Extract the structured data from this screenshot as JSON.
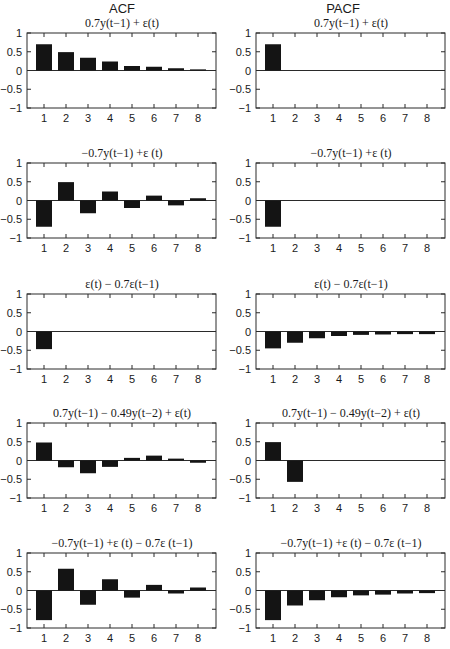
{
  "columns": [
    "ACF",
    "PACF"
  ],
  "chart_data": [
    {
      "type": "bar",
      "column": "ACF",
      "row": 0,
      "title": "0.7y(t−1) + ε(t)",
      "categories": [
        1,
        2,
        3,
        4,
        5,
        6,
        7,
        8
      ],
      "values": [
        0.7,
        0.49,
        0.34,
        0.24,
        0.12,
        0.1,
        0.06,
        0.03
      ],
      "ylim": [
        -1,
        1
      ],
      "yticks": [
        1,
        0.5,
        0,
        -0.5,
        -1
      ],
      "xlabel": "",
      "ylabel": ""
    },
    {
      "type": "bar",
      "column": "PACF",
      "row": 0,
      "title": "0.7y(t−1) + ε(t)",
      "categories": [
        1,
        2,
        3,
        4,
        5,
        6,
        7,
        8
      ],
      "values": [
        0.7,
        0,
        0,
        0,
        0,
        0,
        0,
        0
      ],
      "ylim": [
        -1,
        1
      ],
      "yticks": [
        1,
        0.5,
        0,
        -0.5,
        -1
      ],
      "xlabel": "",
      "ylabel": ""
    },
    {
      "type": "bar",
      "column": "ACF",
      "row": 1,
      "title": "−0.7y(t−1) +ε (t)",
      "categories": [
        1,
        2,
        3,
        4,
        5,
        6,
        7,
        8
      ],
      "values": [
        -0.7,
        0.49,
        -0.34,
        0.24,
        -0.2,
        0.13,
        -0.13,
        0.06
      ],
      "ylim": [
        -1,
        1
      ],
      "yticks": [
        1,
        0.5,
        0,
        -0.5,
        -1
      ],
      "xlabel": "",
      "ylabel": ""
    },
    {
      "type": "bar",
      "column": "PACF",
      "row": 1,
      "title": "−0.7y(t−1) +ε (t)",
      "categories": [
        1,
        2,
        3,
        4,
        5,
        6,
        7,
        8
      ],
      "values": [
        -0.7,
        0,
        0,
        0,
        0,
        0,
        0,
        0
      ],
      "ylim": [
        -1,
        1
      ],
      "yticks": [
        1,
        0.5,
        0,
        -0.5,
        -1
      ],
      "xlabel": "",
      "ylabel": ""
    },
    {
      "type": "bar",
      "column": "ACF",
      "row": 2,
      "title": "ε(t) − 0.7ε(t−1)",
      "categories": [
        1,
        2,
        3,
        4,
        5,
        6,
        7,
        8
      ],
      "values": [
        -0.47,
        0,
        0,
        0,
        0,
        0,
        0,
        0
      ],
      "ylim": [
        -1,
        1
      ],
      "yticks": [
        1,
        0.5,
        0,
        -0.5,
        -1
      ],
      "xlabel": "",
      "ylabel": ""
    },
    {
      "type": "bar",
      "column": "PACF",
      "row": 2,
      "title": "ε(t) − 0.7ε(t−1)",
      "categories": [
        1,
        2,
        3,
        4,
        5,
        6,
        7,
        8
      ],
      "values": [
        -0.45,
        -0.3,
        -0.18,
        -0.12,
        -0.09,
        -0.08,
        -0.07,
        -0.07
      ],
      "ylim": [
        -1,
        1
      ],
      "yticks": [
        1,
        0.5,
        0,
        -0.5,
        -1
      ],
      "xlabel": "",
      "ylabel": ""
    },
    {
      "type": "bar",
      "column": "ACF",
      "row": 3,
      "title": "0.7y(t−1) − 0.49y(t−2) + ε(t)",
      "categories": [
        1,
        2,
        3,
        4,
        5,
        6,
        7,
        8
      ],
      "values": [
        0.48,
        -0.18,
        -0.34,
        -0.17,
        0.07,
        0.13,
        0.05,
        -0.06
      ],
      "ylim": [
        -1,
        1
      ],
      "yticks": [
        1,
        0.5,
        0,
        -0.5,
        -1
      ],
      "xlabel": "",
      "ylabel": ""
    },
    {
      "type": "bar",
      "column": "PACF",
      "row": 3,
      "title": "0.7y(t−1) − 0.49y(t−2) + ε(t)",
      "categories": [
        1,
        2,
        3,
        4,
        5,
        6,
        7,
        8
      ],
      "values": [
        0.49,
        -0.57,
        0,
        0,
        0,
        0,
        0,
        0
      ],
      "ylim": [
        -1,
        1
      ],
      "yticks": [
        1,
        0.5,
        0,
        -0.5,
        -1
      ],
      "xlabel": "",
      "ylabel": ""
    },
    {
      "type": "bar",
      "column": "ACF",
      "row": 4,
      "title": "−0.7y(t−1) +ε (t) − 0.7ε (t−1)",
      "categories": [
        1,
        2,
        3,
        4,
        5,
        6,
        7,
        8
      ],
      "values": [
        -0.79,
        0.58,
        -0.38,
        0.3,
        -0.19,
        0.15,
        -0.08,
        0.08
      ],
      "ylim": [
        -1,
        1
      ],
      "yticks": [
        1,
        0.5,
        0,
        -0.5,
        -1
      ],
      "xlabel": "",
      "ylabel": ""
    },
    {
      "type": "bar",
      "column": "PACF",
      "row": 4,
      "title": "−0.7y(t−1) +ε (t) − 0.7ε (t−1)",
      "categories": [
        1,
        2,
        3,
        4,
        5,
        6,
        7,
        8
      ],
      "values": [
        -0.79,
        -0.4,
        -0.26,
        -0.18,
        -0.13,
        -0.11,
        -0.08,
        -0.07
      ],
      "ylim": [
        -1,
        1
      ],
      "yticks": [
        1,
        0.5,
        0,
        -0.5,
        -1
      ],
      "xlabel": "",
      "ylabel": ""
    }
  ],
  "ytick_labels": [
    "1",
    "0.5",
    "0",
    "−0.5",
    "−1"
  ],
  "xtick_labels": [
    "1",
    "2",
    "3",
    "4",
    "5",
    "6",
    "7",
    "8"
  ],
  "colors": {
    "bar": "#141414",
    "axis": "#2a2a2a",
    "background": "#ffffff"
  }
}
